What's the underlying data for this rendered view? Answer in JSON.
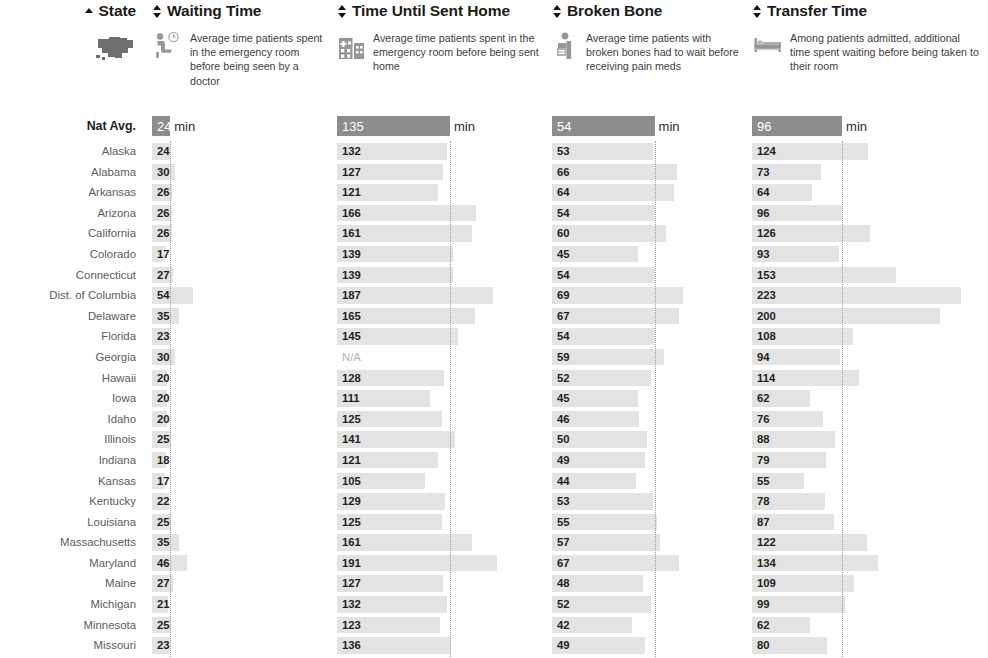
{
  "table": {
    "natavg_row_label": "Nat Avg.",
    "unit_suffix": "min",
    "na_text": "N/A",
    "columns": [
      {
        "key": "state",
        "title": "State",
        "sort": "asc",
        "icon": "us-map-icon"
      },
      {
        "key": "waiting_time",
        "title": "Waiting Time",
        "sort": "none",
        "icon": "seated-patient-clock-icon",
        "description": "Average time patients spent in the emergency room before being seen by a doctor",
        "nat_avg": 24,
        "scale_max": 230
      },
      {
        "key": "time_until_sent_home",
        "title": "Time Until Sent Home",
        "sort": "none",
        "icon": "hospital-building-icon",
        "description": "Average time patients spent in the emergency room before being sent home",
        "nat_avg": 135,
        "scale_max": 245
      },
      {
        "key": "broken_bone",
        "title": "Broken Bone",
        "sort": "none",
        "icon": "patient-arm-cast-icon",
        "description": "Average time patients with broken bones had to wait before receiving pain meds",
        "nat_avg": 54,
        "scale_max": 100
      },
      {
        "key": "transfer_time",
        "title": "Transfer Time",
        "sort": "none",
        "icon": "hospital-bed-icon",
        "description": "Among patients admitted, additional time spent waiting before being taken to their room",
        "nat_avg": 96,
        "scale_max": 245
      }
    ],
    "nat_avg_values": [
      24,
      135,
      54,
      96
    ],
    "rows": [
      {
        "state": "Alaska",
        "waiting_time": 24,
        "time_until_sent_home": 132,
        "broken_bone": 53,
        "transfer_time": 124
      },
      {
        "state": "Alabama",
        "waiting_time": 30,
        "time_until_sent_home": 127,
        "broken_bone": 66,
        "transfer_time": 73
      },
      {
        "state": "Arkansas",
        "waiting_time": 26,
        "time_until_sent_home": 121,
        "broken_bone": 64,
        "transfer_time": 64
      },
      {
        "state": "Arizona",
        "waiting_time": 26,
        "time_until_sent_home": 166,
        "broken_bone": 54,
        "transfer_time": 96
      },
      {
        "state": "California",
        "waiting_time": 26,
        "time_until_sent_home": 161,
        "broken_bone": 60,
        "transfer_time": 126
      },
      {
        "state": "Colorado",
        "waiting_time": 17,
        "time_until_sent_home": 139,
        "broken_bone": 45,
        "transfer_time": 93
      },
      {
        "state": "Connecticut",
        "waiting_time": 27,
        "time_until_sent_home": 139,
        "broken_bone": 54,
        "transfer_time": 153
      },
      {
        "state": "Dist. of Columbia",
        "waiting_time": 54,
        "time_until_sent_home": 187,
        "broken_bone": 69,
        "transfer_time": 223
      },
      {
        "state": "Delaware",
        "waiting_time": 35,
        "time_until_sent_home": 165,
        "broken_bone": 67,
        "transfer_time": 200
      },
      {
        "state": "Florida",
        "waiting_time": 23,
        "time_until_sent_home": 145,
        "broken_bone": 54,
        "transfer_time": 108
      },
      {
        "state": "Georgia",
        "waiting_time": 30,
        "time_until_sent_home": null,
        "broken_bone": 59,
        "transfer_time": 94
      },
      {
        "state": "Hawaii",
        "waiting_time": 20,
        "time_until_sent_home": 128,
        "broken_bone": 52,
        "transfer_time": 114
      },
      {
        "state": "Iowa",
        "waiting_time": 20,
        "time_until_sent_home": 111,
        "broken_bone": 45,
        "transfer_time": 62
      },
      {
        "state": "Idaho",
        "waiting_time": 20,
        "time_until_sent_home": 125,
        "broken_bone": 46,
        "transfer_time": 76
      },
      {
        "state": "Illinois",
        "waiting_time": 25,
        "time_until_sent_home": 141,
        "broken_bone": 50,
        "transfer_time": 88
      },
      {
        "state": "Indiana",
        "waiting_time": 18,
        "time_until_sent_home": 121,
        "broken_bone": 49,
        "transfer_time": 79
      },
      {
        "state": "Kansas",
        "waiting_time": 17,
        "time_until_sent_home": 105,
        "broken_bone": 44,
        "transfer_time": 55
      },
      {
        "state": "Kentucky",
        "waiting_time": 22,
        "time_until_sent_home": 129,
        "broken_bone": 53,
        "transfer_time": 78
      },
      {
        "state": "Louisiana",
        "waiting_time": 25,
        "time_until_sent_home": 125,
        "broken_bone": 55,
        "transfer_time": 87
      },
      {
        "state": "Massachusetts",
        "waiting_time": 35,
        "time_until_sent_home": 161,
        "broken_bone": 57,
        "transfer_time": 122
      },
      {
        "state": "Maryland",
        "waiting_time": 46,
        "time_until_sent_home": 191,
        "broken_bone": 67,
        "transfer_time": 134
      },
      {
        "state": "Maine",
        "waiting_time": 27,
        "time_until_sent_home": 127,
        "broken_bone": 48,
        "transfer_time": 109
      },
      {
        "state": "Michigan",
        "waiting_time": 21,
        "time_until_sent_home": 132,
        "broken_bone": 52,
        "transfer_time": 99
      },
      {
        "state": "Minnesota",
        "waiting_time": 25,
        "time_until_sent_home": 123,
        "broken_bone": 42,
        "transfer_time": 62
      },
      {
        "state": "Missouri",
        "waiting_time": 23,
        "time_until_sent_home": 136,
        "broken_bone": 49,
        "transfer_time": 80
      },
      {
        "state": "Mississippi",
        "waiting_time": 27,
        "time_until_sent_home": 112,
        "broken_bone": 65,
        "transfer_time": 62
      }
    ]
  },
  "chart_data": {
    "type": "table",
    "categories": [
      "Alaska",
      "Alabama",
      "Arkansas",
      "Arizona",
      "California",
      "Colorado",
      "Connecticut",
      "Dist. of Columbia",
      "Delaware",
      "Florida",
      "Georgia",
      "Hawaii",
      "Iowa",
      "Idaho",
      "Illinois",
      "Indiana",
      "Kansas",
      "Kentucky",
      "Louisiana",
      "Massachusetts",
      "Maryland",
      "Maine",
      "Michigan",
      "Minnesota",
      "Missouri",
      "Mississippi"
    ],
    "series": [
      {
        "name": "Waiting Time",
        "unit": "min",
        "national_average": 24,
        "values": [
          24,
          30,
          26,
          26,
          26,
          17,
          27,
          54,
          35,
          23,
          30,
          20,
          20,
          20,
          25,
          18,
          17,
          22,
          25,
          35,
          46,
          27,
          21,
          25,
          23,
          27
        ]
      },
      {
        "name": "Time Until Sent Home",
        "unit": "min",
        "national_average": 135,
        "values": [
          132,
          127,
          121,
          166,
          161,
          139,
          139,
          187,
          165,
          145,
          null,
          128,
          111,
          125,
          141,
          121,
          105,
          129,
          125,
          161,
          191,
          127,
          132,
          123,
          136,
          112
        ]
      },
      {
        "name": "Broken Bone",
        "unit": "min",
        "national_average": 54,
        "values": [
          53,
          66,
          64,
          54,
          60,
          45,
          54,
          69,
          67,
          54,
          59,
          52,
          45,
          46,
          50,
          49,
          44,
          53,
          55,
          57,
          67,
          48,
          52,
          42,
          49,
          65
        ]
      },
      {
        "name": "Transfer Time",
        "unit": "min",
        "national_average": 96,
        "values": [
          124,
          73,
          64,
          96,
          126,
          93,
          153,
          223,
          200,
          108,
          94,
          114,
          62,
          76,
          88,
          79,
          55,
          78,
          87,
          122,
          134,
          109,
          99,
          62,
          80,
          62
        ]
      }
    ],
    "grid": false,
    "legend": "none"
  }
}
